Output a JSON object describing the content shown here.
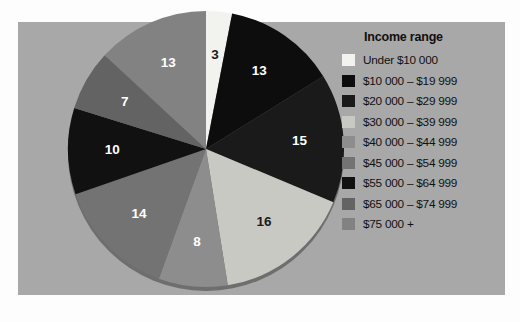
{
  "figure": {
    "background_color": "#a8a8a8",
    "page_color": "#fdfdfd"
  },
  "legend": {
    "title": "Income range",
    "items": [
      {
        "label": "Under  $10 000",
        "color": "#f2f2ee"
      },
      {
        "label": "$10 000 – $19 999",
        "color": "#0d0d0d"
      },
      {
        "label": "$20 000 – $29 999",
        "color": "#1a1a1a"
      },
      {
        "label": "$30 000 – $39 999",
        "color": "#c9c9c4"
      },
      {
        "label": "$40 000 – $44 999",
        "color": "#8d8d8d"
      },
      {
        "label": "$45 000 – $54 999",
        "color": "#737373"
      },
      {
        "label": "$55 000 – $64 999",
        "color": "#111111"
      },
      {
        "label": "$65 000 – $74 999",
        "color": "#636363"
      },
      {
        "label": "$75 000 +",
        "color": "#828282"
      }
    ]
  },
  "chart_data": {
    "type": "pie",
    "title": "",
    "legend_title": "Income range",
    "legend_position": "right",
    "start_angle_deg": -90,
    "direction": "clockwise",
    "total": 99,
    "unit": "percent",
    "categories": [
      "Under $10 000",
      "$10 000 – $19 999",
      "$20 000 – $29 999",
      "$30 000 – $39 999",
      "$40 000 – $44 999",
      "$45 000 – $54 999",
      "$55 000 – $64 999",
      "$65 000 – $74 999",
      "$75 000 +"
    ],
    "values": [
      3,
      13,
      15,
      16,
      8,
      14,
      10,
      7,
      13
    ],
    "labels": [
      "3",
      "13",
      "15",
      "16",
      "8",
      "14",
      "10",
      "7",
      "13"
    ],
    "colors": [
      "#f2f2ee",
      "#0d0d0d",
      "#1a1a1a",
      "#c9c9c4",
      "#8d8d8d",
      "#737373",
      "#111111",
      "#636363",
      "#828282"
    ],
    "label_colors": [
      "dark",
      "light",
      "light",
      "dark",
      "light",
      "light",
      "light",
      "light",
      "light"
    ]
  }
}
